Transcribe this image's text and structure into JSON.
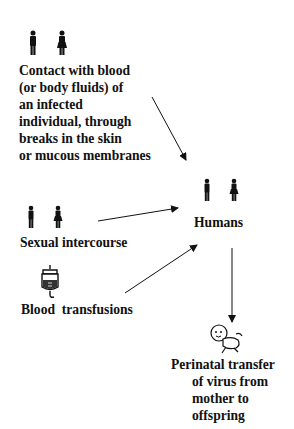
{
  "nodes": {
    "contact": {
      "icon": "man-woman-icon",
      "lines": [
        "Contact with blood",
        "(or body fluids) of",
        "an infected",
        "individual, through",
        "breaks in the skin",
        "or mucous membranes"
      ]
    },
    "sexual": {
      "icon": "man-woman-icon",
      "label": "Sexual intercourse"
    },
    "blood": {
      "icon": "blood-bag-icon",
      "label": "Blood  transfusions"
    },
    "humans": {
      "icon": "man-woman-icon",
      "label": "Humans"
    },
    "perinatal": {
      "icon": "baby-icon",
      "lines": [
        "Perinatal transfer",
        "of virus from",
        "mother to",
        "offspring"
      ]
    }
  },
  "edges": [
    {
      "from": "contact",
      "to": "humans"
    },
    {
      "from": "sexual",
      "to": "humans"
    },
    {
      "from": "blood",
      "to": "humans"
    },
    {
      "from": "humans",
      "to": "perinatal"
    }
  ]
}
